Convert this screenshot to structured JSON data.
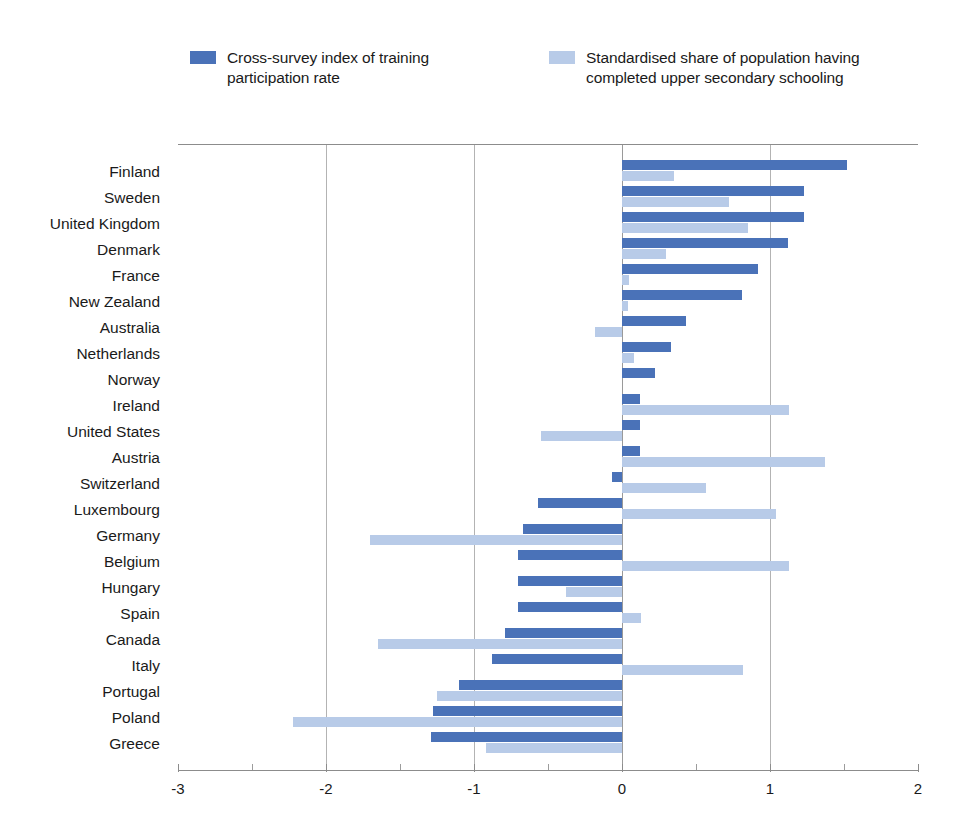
{
  "legend": {
    "items": [
      {
        "label": "Cross-survey index of training\nparticipation rate",
        "color": "#4a72b8",
        "key": "training"
      },
      {
        "label": "Standardised share of population having\ncompleted upper secondary schooling",
        "color": "#b8cbe8",
        "key": "schooling"
      }
    ]
  },
  "chart_data": {
    "type": "bar",
    "orientation": "horizontal",
    "title": "",
    "subtitle": "",
    "xlabel": "",
    "ylabel": "",
    "xlim": [
      -3,
      2
    ],
    "xticks": [
      -3,
      -2,
      -1,
      0,
      1,
      2
    ],
    "xtick_labels": [
      "-3",
      "-2",
      "-1",
      "0",
      "1",
      "2"
    ],
    "grid": true,
    "grid_axis": "x",
    "legend_position": "top",
    "categories": [
      "Finland",
      "Sweden",
      "United Kingdom",
      "Denmark",
      "France",
      "New Zealand",
      "Australia",
      "Netherlands",
      "Norway",
      "Ireland",
      "United States",
      "Austria",
      "Switzerland",
      "Luxembourg",
      "Germany",
      "Belgium",
      "Hungary",
      "Spain",
      "Canada",
      "Italy",
      "Portugal",
      "Poland",
      "Greece"
    ],
    "series": [
      {
        "name": "Cross-survey index of training participation rate",
        "color": "#4a72b8",
        "values": [
          1.52,
          1.23,
          1.23,
          1.12,
          0.92,
          0.81,
          0.43,
          0.33,
          0.22,
          0.12,
          0.12,
          0.12,
          -0.07,
          -0.57,
          -0.67,
          -0.7,
          -0.7,
          -0.7,
          -0.79,
          -0.88,
          -1.1,
          -1.28,
          -1.29
        ]
      },
      {
        "name": "Standardised share of population having completed upper secondary schooling",
        "color": "#b8cbe8",
        "values": [
          0.35,
          0.72,
          0.85,
          0.3,
          0.05,
          0.04,
          -0.18,
          0.08,
          0.0,
          1.13,
          -0.55,
          1.37,
          0.57,
          1.04,
          -1.7,
          1.13,
          -0.38,
          0.13,
          -1.65,
          0.82,
          -1.25,
          -2.22,
          -0.92
        ]
      }
    ]
  }
}
